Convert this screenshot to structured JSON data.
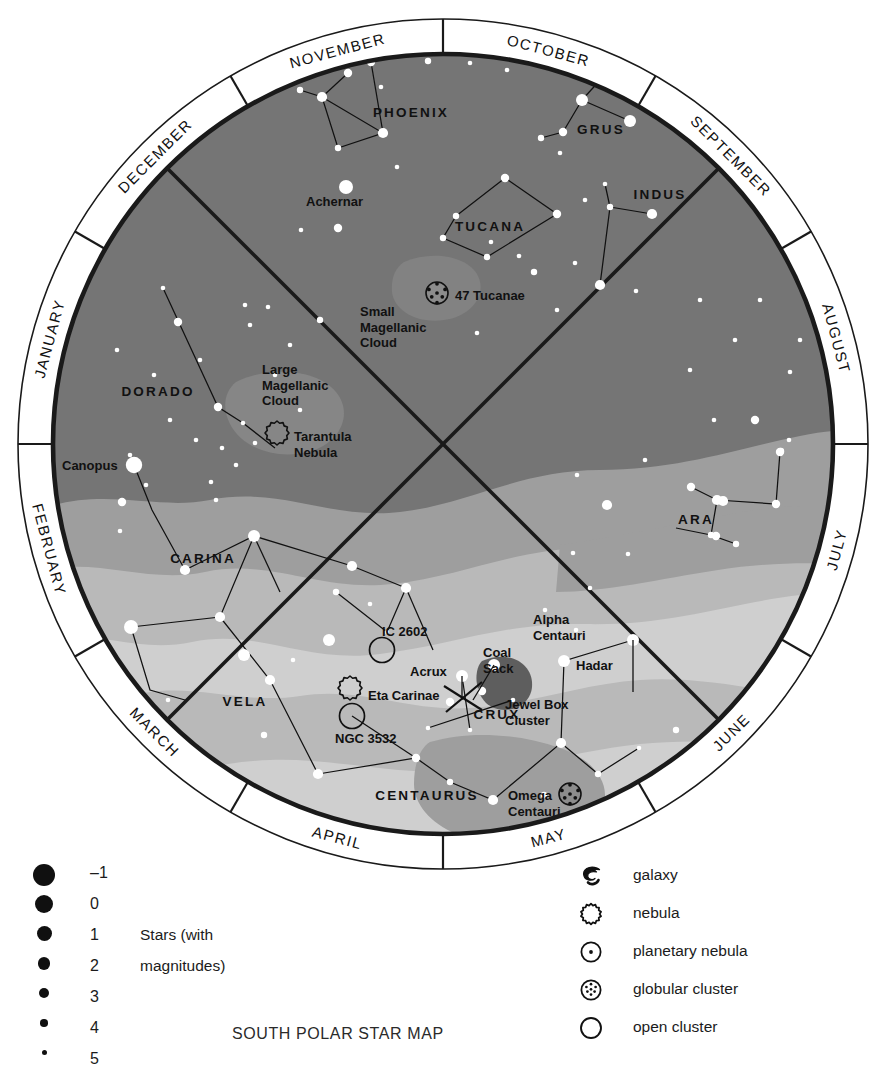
{
  "title": "SOUTH POLAR STAR MAP",
  "map": {
    "months": [
      "OCTOBER",
      "SEPTEMBER",
      "AUGUST",
      "JULY",
      "JUNE",
      "MAY",
      "APRIL",
      "MARCH",
      "FEBRUARY",
      "JANUARY",
      "DECEMBER",
      "NOVEMBER"
    ],
    "constellations": [
      "PHOENIX",
      "GRUS",
      "INDUS",
      "TUCANA",
      "DORADO",
      "CARINA",
      "VELA",
      "CENTAURUS",
      "CRUX",
      "ARA"
    ],
    "deep_sky": [
      "Achernar",
      "Small Magellanic Cloud",
      "47 Tucanae",
      "Large Magellanic Cloud",
      "Tarantula Nebula",
      "Canopus",
      "IC 2602",
      "Eta Carinae",
      "NGC 3532",
      "Acrux",
      "Coal Sack",
      "Jewel Box Cluster",
      "Alpha Centauri",
      "Hadar",
      "Omega Centauri"
    ],
    "labels": {
      "achernar": "Achernar",
      "smc": [
        "Small",
        "Magellanic",
        "Cloud"
      ],
      "tuc47": "47 Tucanae",
      "lmc": [
        "Large",
        "Magellanic",
        "Cloud"
      ],
      "tarantula": [
        "Tarantula",
        "Nebula"
      ],
      "canopus": "Canopus",
      "ic2602": "IC 2602",
      "etacarinae": "Eta Carinae",
      "ngc3532": "NGC 3532",
      "acrux": "Acrux",
      "coalsack": [
        "Coal",
        "Sack"
      ],
      "jewelbox": [
        "Jewel Box",
        "Cluster"
      ],
      "alphacen": [
        "Alpha",
        "Centauri"
      ],
      "hadar": "Hadar",
      "omegacen": [
        "Omega",
        "Centauri"
      ]
    },
    "colors": {
      "sky": "#757575",
      "milkyway_mid": "#9e9e9e",
      "milkyway_light": "#b9b9b9",
      "milkyway_bright": "#cfcfcf",
      "dark_nebula": "#5e5e5e",
      "ring": "#ffffff",
      "outline": "#1a1a1a",
      "star": "#ffffff",
      "text": "#111111"
    }
  },
  "legend": {
    "magnitudes": {
      "note_lines": [
        "Stars (with",
        "magnitudes)"
      ],
      "rows": [
        {
          "value": "–1",
          "size": 22
        },
        {
          "value": "0",
          "size": 18
        },
        {
          "value": "1",
          "size": 15
        },
        {
          "value": "2",
          "size": 12.5
        },
        {
          "value": "3",
          "size": 10
        },
        {
          "value": "4",
          "size": 7.5
        },
        {
          "value": "5",
          "size": 5
        }
      ]
    },
    "symbols": [
      {
        "icon": "galaxy-icon",
        "label": "galaxy"
      },
      {
        "icon": "nebula-icon",
        "label": "nebula"
      },
      {
        "icon": "planetary-nebula-icon",
        "label": "planetary nebula"
      },
      {
        "icon": "globular-cluster-icon",
        "label": "globular cluster"
      },
      {
        "icon": "open-cluster-icon",
        "label": "open cluster"
      }
    ]
  },
  "chart_data": {
    "type": "map",
    "title": "SOUTH POLAR STAR MAP",
    "projection": "south polar azimuthal",
    "center": {
      "x": 443,
      "y": 444
    },
    "outer_radius": 425,
    "inner_radius": 390,
    "month_ring_divisions": 12,
    "month_ring_start_angle_deg": -75,
    "stars": [
      {
        "x": 348,
        "y": 73,
        "m": 3.2
      },
      {
        "x": 322,
        "y": 97,
        "m": 2.2
      },
      {
        "x": 300,
        "y": 90,
        "m": 4
      },
      {
        "x": 338,
        "y": 148,
        "m": 3.4
      },
      {
        "x": 383,
        "y": 133,
        "m": 2.3
      },
      {
        "x": 371,
        "y": 62,
        "m": 3
      },
      {
        "x": 428,
        "y": 61,
        "m": 3.6
      },
      {
        "x": 470,
        "y": 63,
        "m": 4.2
      },
      {
        "x": 507,
        "y": 70,
        "m": 4.2
      },
      {
        "x": 381,
        "y": 87,
        "m": 4.4
      },
      {
        "x": 397,
        "y": 167,
        "m": 4.4
      },
      {
        "x": 582,
        "y": 100,
        "m": 1.6
      },
      {
        "x": 630,
        "y": 121,
        "m": 1.8
      },
      {
        "x": 563,
        "y": 132,
        "m": 3.2
      },
      {
        "x": 541,
        "y": 138,
        "m": 3.8
      },
      {
        "x": 560,
        "y": 153,
        "m": 4.6
      },
      {
        "x": 346,
        "y": 187,
        "m": 0.5
      },
      {
        "x": 338,
        "y": 228,
        "m": 3.2
      },
      {
        "x": 301,
        "y": 230,
        "m": 4.4
      },
      {
        "x": 505,
        "y": 178,
        "m": 2.8
      },
      {
        "x": 557,
        "y": 214,
        "m": 3.0
      },
      {
        "x": 456,
        "y": 216,
        "m": 3.6
      },
      {
        "x": 443,
        "y": 238,
        "m": 4.0
      },
      {
        "x": 487,
        "y": 257,
        "m": 3.8
      },
      {
        "x": 491,
        "y": 242,
        "m": 4.6
      },
      {
        "x": 605,
        "y": 184,
        "m": 4.2
      },
      {
        "x": 585,
        "y": 200,
        "m": 4.6
      },
      {
        "x": 652,
        "y": 214,
        "m": 2.6
      },
      {
        "x": 610,
        "y": 207,
        "m": 3.6
      },
      {
        "x": 519,
        "y": 256,
        "m": 4.4
      },
      {
        "x": 534,
        "y": 272,
        "m": 3.4
      },
      {
        "x": 477,
        "y": 333,
        "m": 4.6
      },
      {
        "x": 430,
        "y": 290,
        "m": 4.6
      },
      {
        "x": 600,
        "y": 285,
        "m": 2.0
      },
      {
        "x": 575,
        "y": 263,
        "m": 4.2
      },
      {
        "x": 636,
        "y": 291,
        "m": 4.4
      },
      {
        "x": 557,
        "y": 310,
        "m": 4.2
      },
      {
        "x": 163,
        "y": 288,
        "m": 4.2
      },
      {
        "x": 178,
        "y": 322,
        "m": 3.2
      },
      {
        "x": 200,
        "y": 360,
        "m": 4.4
      },
      {
        "x": 218,
        "y": 407,
        "m": 3.2
      },
      {
        "x": 243,
        "y": 423,
        "m": 4.4
      },
      {
        "x": 117,
        "y": 350,
        "m": 4.6
      },
      {
        "x": 154,
        "y": 375,
        "m": 4.4
      },
      {
        "x": 170,
        "y": 420,
        "m": 4.6
      },
      {
        "x": 130,
        "y": 455,
        "m": 4.4
      },
      {
        "x": 134,
        "y": 465,
        "m": 0.0
      },
      {
        "x": 146,
        "y": 485,
        "m": 4.4
      },
      {
        "x": 122,
        "y": 502,
        "m": 3.2
      },
      {
        "x": 120,
        "y": 531,
        "m": 4.6
      },
      {
        "x": 196,
        "y": 440,
        "m": 4.2
      },
      {
        "x": 222,
        "y": 448,
        "m": 4.6
      },
      {
        "x": 290,
        "y": 345,
        "m": 4.2
      },
      {
        "x": 320,
        "y": 320,
        "m": 4.0
      },
      {
        "x": 275,
        "y": 375,
        "m": 4.6
      },
      {
        "x": 250,
        "y": 325,
        "m": 4.6
      },
      {
        "x": 245,
        "y": 305,
        "m": 4.6
      },
      {
        "x": 268,
        "y": 307,
        "m": 4.2
      },
      {
        "x": 300,
        "y": 410,
        "m": 4.4
      },
      {
        "x": 255,
        "y": 443,
        "m": 4.4
      },
      {
        "x": 236,
        "y": 465,
        "m": 4.6
      },
      {
        "x": 211,
        "y": 482,
        "m": 4.4
      },
      {
        "x": 216,
        "y": 500,
        "m": 4.4
      },
      {
        "x": 700,
        "y": 300,
        "m": 4.4
      },
      {
        "x": 735,
        "y": 340,
        "m": 4.2
      },
      {
        "x": 690,
        "y": 370,
        "m": 4.4
      },
      {
        "x": 760,
        "y": 300,
        "m": 4.6
      },
      {
        "x": 790,
        "y": 372,
        "m": 4.2
      },
      {
        "x": 800,
        "y": 340,
        "m": 4.4
      },
      {
        "x": 755,
        "y": 420,
        "m": 3.2
      },
      {
        "x": 714,
        "y": 420,
        "m": 4.4
      },
      {
        "x": 780,
        "y": 452,
        "m": 3.2
      },
      {
        "x": 789,
        "y": 440,
        "m": 4.4
      },
      {
        "x": 691,
        "y": 487,
        "m": 3.0
      },
      {
        "x": 717,
        "y": 500,
        "m": 2.6
      },
      {
        "x": 723,
        "y": 501,
        "m": 2.6
      },
      {
        "x": 776,
        "y": 504,
        "m": 2.8
      },
      {
        "x": 781,
        "y": 451,
        "m": 3.4
      },
      {
        "x": 711,
        "y": 535,
        "m": 3.4
      },
      {
        "x": 716,
        "y": 536,
        "m": 3.2
      },
      {
        "x": 736,
        "y": 544,
        "m": 4.0
      },
      {
        "x": 607,
        "y": 505,
        "m": 2.2
      },
      {
        "x": 577,
        "y": 475,
        "m": 4.4
      },
      {
        "x": 645,
        "y": 460,
        "m": 4.6
      },
      {
        "x": 573,
        "y": 553,
        "m": 4.4
      },
      {
        "x": 628,
        "y": 554,
        "m": 4.2
      },
      {
        "x": 590,
        "y": 588,
        "m": 4.4
      },
      {
        "x": 545,
        "y": 610,
        "m": 4.2
      },
      {
        "x": 576,
        "y": 630,
        "m": 4.4
      },
      {
        "x": 633,
        "y": 640,
        "m": 1.4
      },
      {
        "x": 564,
        "y": 661,
        "m": 1.6
      },
      {
        "x": 561,
        "y": 743,
        "m": 2.2
      },
      {
        "x": 544,
        "y": 795,
        "m": 4.0
      },
      {
        "x": 598,
        "y": 774,
        "m": 3.6
      },
      {
        "x": 639,
        "y": 748,
        "m": 4.2
      },
      {
        "x": 676,
        "y": 730,
        "m": 3.4
      },
      {
        "x": 370,
        "y": 604,
        "m": 4.4
      },
      {
        "x": 329,
        "y": 640,
        "m": 1.8
      },
      {
        "x": 293,
        "y": 660,
        "m": 4.2
      },
      {
        "x": 270,
        "y": 680,
        "m": 2.2
      },
      {
        "x": 244,
        "y": 655,
        "m": 1.8
      },
      {
        "x": 220,
        "y": 617,
        "m": 2.2
      },
      {
        "x": 131,
        "y": 627,
        "m": 1.2
      },
      {
        "x": 185,
        "y": 570,
        "m": 2.0
      },
      {
        "x": 254,
        "y": 536,
        "m": 1.6
      },
      {
        "x": 352,
        "y": 566,
        "m": 2.4
      },
      {
        "x": 406,
        "y": 588,
        "m": 2.6
      },
      {
        "x": 336,
        "y": 592,
        "m": 3.4
      },
      {
        "x": 387,
        "y": 632,
        "m": 4.2
      },
      {
        "x": 318,
        "y": 774,
        "m": 2.4
      },
      {
        "x": 416,
        "y": 758,
        "m": 3.2
      },
      {
        "x": 450,
        "y": 782,
        "m": 3.4
      },
      {
        "x": 493,
        "y": 800,
        "m": 2.2
      },
      {
        "x": 264,
        "y": 735,
        "m": 3.6
      },
      {
        "x": 168,
        "y": 700,
        "m": 4.2
      },
      {
        "x": 213,
        "y": 760,
        "m": 4.4
      },
      {
        "x": 462,
        "y": 676,
        "m": 1.6
      },
      {
        "x": 450,
        "y": 702,
        "m": 2.8
      },
      {
        "x": 482,
        "y": 691,
        "m": 3.2
      },
      {
        "x": 494,
        "y": 665,
        "m": 1.3
      },
      {
        "x": 513,
        "y": 700,
        "m": 4.2
      },
      {
        "x": 470,
        "y": 730,
        "m": 4.2
      },
      {
        "x": 428,
        "y": 728,
        "m": 4.4
      }
    ],
    "deep_sky_objects": [
      {
        "name": "47 Tucanae",
        "type": "globular cluster",
        "x": 437,
        "y": 293
      },
      {
        "name": "Tarantula Nebula",
        "type": "nebula",
        "x": 277,
        "y": 433
      },
      {
        "name": "IC 2602",
        "type": "open cluster",
        "x": 382,
        "y": 650
      },
      {
        "name": "Eta Carinae",
        "type": "nebula",
        "x": 350,
        "y": 688
      },
      {
        "name": "NGC 3532",
        "type": "open cluster",
        "x": 352,
        "y": 716
      },
      {
        "name": "Omega Centauri",
        "type": "globular cluster",
        "x": 570,
        "y": 794
      },
      {
        "name": "Coal Sack",
        "type": "dark nebula",
        "x": 506,
        "y": 685
      }
    ]
  }
}
